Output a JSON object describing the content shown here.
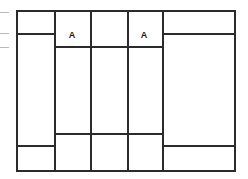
{
  "diagram": {
    "type": "line-grid",
    "width": 248,
    "height": 179,
    "line_color": "#2b2b2b",
    "tick_color": "#b9b9b9",
    "background": "#ffffff",
    "labels": [
      {
        "text": "A",
        "x": 72,
        "y": 31,
        "name": "cell-label-a-left"
      },
      {
        "text": "A",
        "x": 144,
        "y": 31,
        "name": "cell-label-a-right"
      }
    ],
    "vertical_lines": [
      {
        "name": "vline-outer-left",
        "x": 16,
        "y1": 10,
        "y2": 171
      },
      {
        "name": "vline-col1-right",
        "x": 54,
        "y1": 10,
        "y2": 171
      },
      {
        "name": "vline-col2-right",
        "x": 90,
        "y1": 10,
        "y2": 171
      },
      {
        "name": "vline-col3-right",
        "x": 127,
        "y1": 10,
        "y2": 171
      },
      {
        "name": "vline-col4-right",
        "x": 162,
        "y1": 10,
        "y2": 171
      },
      {
        "name": "vline-outer-right",
        "x": 234,
        "y1": 10,
        "y2": 171
      }
    ],
    "horizontal_lines": [
      {
        "name": "hline-top-border",
        "y": 10,
        "x1": 16,
        "x2": 236
      },
      {
        "name": "hline-left-upper-divider",
        "y": 33,
        "x1": 16,
        "x2": 56
      },
      {
        "name": "hline-right-upper-divider",
        "y": 33,
        "x1": 162,
        "x2": 236
      },
      {
        "name": "hline-inner-upper-divider",
        "y": 46,
        "x1": 54,
        "x2": 163
      },
      {
        "name": "hline-inner-lower-divider",
        "y": 133,
        "x1": 54,
        "x2": 163
      },
      {
        "name": "hline-left-lower-divider",
        "y": 145,
        "x1": 16,
        "x2": 56
      },
      {
        "name": "hline-right-lower-divider",
        "y": 145,
        "x1": 162,
        "x2": 236
      },
      {
        "name": "hline-bottom-border",
        "y": 170,
        "x1": 16,
        "x2": 236
      }
    ],
    "margin_ticks": [
      {
        "name": "margin-tick-1",
        "x": 0,
        "y": 12,
        "width": 9
      },
      {
        "name": "margin-tick-2",
        "x": 0,
        "y": 33,
        "width": 9
      },
      {
        "name": "margin-tick-3",
        "x": 0,
        "y": 47,
        "width": 9
      }
    ]
  }
}
